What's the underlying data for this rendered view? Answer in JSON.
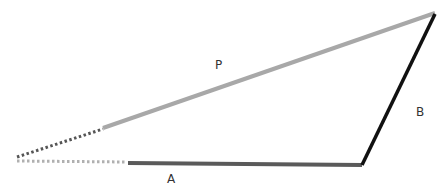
{
  "diagram": {
    "labels": {
      "P": "P",
      "A": "A",
      "B": "B"
    },
    "colors": {
      "P": "#a8a8a8",
      "A": "#5a5a5a",
      "B": "#111111",
      "dotted_upper": "#555555",
      "dotted_lower": "#b0b0b0"
    },
    "segments": [
      {
        "name": "P",
        "from": [
          103,
          128
        ],
        "to": [
          435,
          13
        ],
        "style": "solid"
      },
      {
        "name": "A",
        "from": [
          128,
          163
        ],
        "to": [
          362,
          165
        ],
        "style": "solid"
      },
      {
        "name": "B",
        "from": [
          362,
          165
        ],
        "to": [
          435,
          13
        ],
        "style": "solid"
      },
      {
        "name": "P-extension",
        "from": [
          17,
          157
        ],
        "to": [
          103,
          129
        ],
        "style": "dotted"
      },
      {
        "name": "A-extension",
        "from": [
          17,
          161
        ],
        "to": [
          127,
          162
        ],
        "style": "dotted"
      }
    ]
  }
}
